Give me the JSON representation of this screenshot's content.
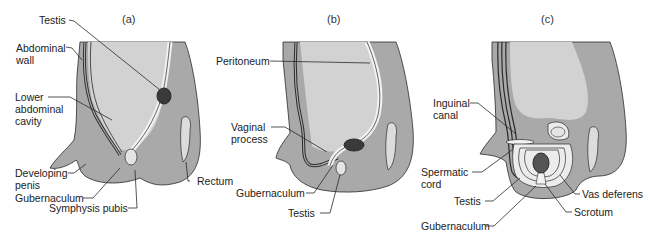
{
  "figure": {
    "type": "anatomical-diagram",
    "colors": {
      "body_tissue": "#a9a9a9",
      "cavity": "#d2d2d2",
      "tube_light": "#f2f2f2",
      "testis_dark": "#3a3a3a",
      "outline": "#2a2a2a",
      "background": "#ffffff"
    }
  },
  "panels": [
    {
      "letter": "(a)",
      "labels": {
        "testis": "Testis",
        "abdominal_wall_1": "Abdominal",
        "abdominal_wall_2": "wall",
        "lower_cavity_1": "Lower",
        "lower_cavity_2": "abdominal",
        "lower_cavity_3": "cavity",
        "penis_1": "Developing",
        "penis_2": "penis",
        "gubernaculum": "Gubernaculum",
        "symphysis": "Symphysis pubis",
        "rectum": "Rectum"
      }
    },
    {
      "letter": "(b)",
      "labels": {
        "peritoneum": "Peritoneum",
        "vaginal_1": "Vaginal",
        "vaginal_2": "process",
        "gubernaculum": "Gubernaculum",
        "testis": "Testis"
      }
    },
    {
      "letter": "(c)",
      "labels": {
        "inguinal_1": "Inguinal",
        "inguinal_2": "canal",
        "spermatic_1": "Spermatic",
        "spermatic_2": "cord",
        "testis": "Testis",
        "gubernaculum": "Gubernaculum",
        "vas_deferens": "Vas deferens",
        "scrotum": "Scrotum"
      }
    }
  ]
}
